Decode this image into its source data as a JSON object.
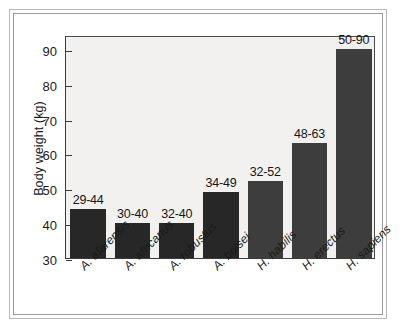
{
  "chart_data": {
    "type": "bar",
    "title": "",
    "subtitle": "",
    "xlabel": "",
    "ylabel": "Body weight (kg)",
    "ylim": [
      30,
      94
    ],
    "yticks": [
      30,
      40,
      50,
      60,
      70,
      80,
      90
    ],
    "ytick_labels": [
      "30",
      "40",
      "50",
      "60",
      "70",
      "80",
      "90"
    ],
    "grid": false,
    "legend": "none",
    "categories": [
      "A. afarensis",
      "A. africanus",
      "A. robustus",
      "A. boisei",
      "H. habilis",
      "H. erectus",
      "H. sapiens"
    ],
    "values": [
      44,
      40,
      40,
      49,
      52,
      63,
      90
    ],
    "data_labels": [
      "29-44",
      "30-40",
      "32-40",
      "34-49",
      "32-52",
      "48-63",
      "50-90"
    ],
    "ranges": [
      {
        "category": "A. afarensis",
        "min": 29,
        "max": 44
      },
      {
        "category": "A. africanus",
        "min": 30,
        "max": 40
      },
      {
        "category": "A. robustus",
        "min": 32,
        "max": 40
      },
      {
        "category": "A. boisei",
        "min": 34,
        "max": 49
      },
      {
        "category": "H. habilis",
        "min": 32,
        "max": 52
      },
      {
        "category": "H. erectus",
        "min": 48,
        "max": 63
      },
      {
        "category": "H. sapiens",
        "min": 50,
        "max": 90
      }
    ],
    "bar_colors": [
      "#272727",
      "#272727",
      "#272727",
      "#272727",
      "#3d3d3d",
      "#3d3d3d",
      "#3d3d3d"
    ],
    "plot_background": "#f2f1ef",
    "axis_color": "#3a3a3a",
    "figure_background": "#ffffff",
    "frame_color": "#a8a8a8"
  }
}
